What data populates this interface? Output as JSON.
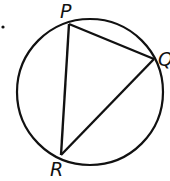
{
  "diagram": {
    "type": "geometry",
    "circle": {
      "cx": 90,
      "cy": 92,
      "r": 73
    },
    "points": [
      {
        "id": "P",
        "label": "P",
        "x": 69,
        "y": 24,
        "lx": 60,
        "ly": 18
      },
      {
        "id": "Q",
        "label": "Q",
        "x": 154,
        "y": 59,
        "lx": 158,
        "ly": 66
      },
      {
        "id": "R",
        "label": "R",
        "x": 61,
        "y": 155,
        "lx": 50,
        "ly": 176
      }
    ],
    "segments": [
      [
        "P",
        "Q"
      ],
      [
        "Q",
        "R"
      ],
      [
        "R",
        "P"
      ]
    ],
    "bullet": {
      "x": 3,
      "y": 27
    }
  }
}
